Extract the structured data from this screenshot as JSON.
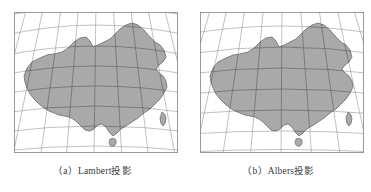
{
  "figure": {
    "panels": [
      {
        "id": "a",
        "label_prefix": "（a）",
        "label_name": "Lambert",
        "label_suffix": "投影",
        "caption": "（a）Lambert投影",
        "projection": "Lambert",
        "map_region": "China",
        "fill_color": "#a9a9a9",
        "outline_color": "#6b6b6b",
        "grid_color": "#8d8d8d",
        "grid_color_over_land": "#5d5d5d",
        "frame_color": "#8a8a8a",
        "background_color": "#ffffff"
      },
      {
        "id": "b",
        "label_prefix": "（b）",
        "label_name": "Albers",
        "label_suffix": "投影",
        "caption": "（b）Albers投影",
        "projection": "Albers",
        "map_region": "China",
        "fill_color": "#a9a9a9",
        "outline_color": "#6b6b6b",
        "grid_color": "#8d8d8d",
        "grid_color_over_land": "#5d5d5d",
        "frame_color": "#8a8a8a",
        "background_color": "#ffffff"
      }
    ],
    "graticule": {
      "meridian_count": 9,
      "parallel_count": 8,
      "style": "curved"
    }
  }
}
